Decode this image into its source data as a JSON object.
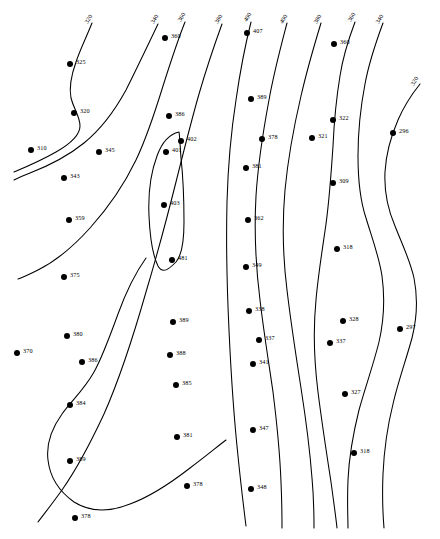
{
  "figure": {
    "type": "contour-map",
    "background_color": "#ffffff",
    "line_color": "#000000",
    "point_color": "#000000",
    "width": 440,
    "height": 539
  },
  "chart_data": {
    "type": "scatter",
    "title": "",
    "subtitle": "",
    "xlabel": "",
    "ylabel": "",
    "grid": false,
    "legend": null,
    "axis_visible": false,
    "contour_interval": 20,
    "contour_labels": [
      {
        "value": "320",
        "x": 86,
        "y": 20,
        "rotation": -58
      },
      {
        "value": "340",
        "x": 152,
        "y": 20,
        "rotation": -58
      },
      {
        "value": "360",
        "x": 179,
        "y": 18,
        "rotation": -58
      },
      {
        "value": "380",
        "x": 216,
        "y": 20,
        "rotation": -58
      },
      {
        "value": "400",
        "x": 245,
        "y": 18,
        "rotation": -58
      },
      {
        "value": "400",
        "x": 281,
        "y": 20,
        "rotation": -58
      },
      {
        "value": "380",
        "x": 315,
        "y": 20,
        "rotation": -58
      },
      {
        "value": "360",
        "x": 349,
        "y": 18,
        "rotation": -58
      },
      {
        "value": "340",
        "x": 377,
        "y": 20,
        "rotation": -58
      },
      {
        "value": "320",
        "x": 412,
        "y": 82,
        "rotation": -58
      }
    ],
    "points": [
      {
        "label": "325",
        "x": 70,
        "y": 64
      },
      {
        "label": "320",
        "x": 74,
        "y": 113
      },
      {
        "label": "310",
        "x": 31,
        "y": 150
      },
      {
        "label": "345",
        "x": 99,
        "y": 152
      },
      {
        "label": "343",
        "x": 64,
        "y": 178
      },
      {
        "label": "359",
        "x": 69,
        "y": 220
      },
      {
        "label": "375",
        "x": 64,
        "y": 277
      },
      {
        "label": "370",
        "x": 17,
        "y": 353
      },
      {
        "label": "380",
        "x": 67,
        "y": 336
      },
      {
        "label": "386",
        "x": 82,
        "y": 362
      },
      {
        "label": "384",
        "x": 70,
        "y": 405
      },
      {
        "label": "389",
        "x": 70,
        "y": 461
      },
      {
        "label": "378",
        "x": 75,
        "y": 518
      },
      {
        "label": "360",
        "x": 165,
        "y": 38
      },
      {
        "label": "386",
        "x": 169,
        "y": 116
      },
      {
        "label": "402",
        "x": 181,
        "y": 141
      },
      {
        "label": "401",
        "x": 166,
        "y": 152
      },
      {
        "label": "403",
        "x": 164,
        "y": 205
      },
      {
        "label": "481",
        "x": 172,
        "y": 260
      },
      {
        "label": "389",
        "x": 173,
        "y": 322
      },
      {
        "label": "388",
        "x": 170,
        "y": 355
      },
      {
        "label": "385",
        "x": 176,
        "y": 385
      },
      {
        "label": "381",
        "x": 177,
        "y": 437
      },
      {
        "label": "378",
        "x": 187,
        "y": 486
      },
      {
        "label": "407",
        "x": 247,
        "y": 33
      },
      {
        "label": "389",
        "x": 251,
        "y": 99
      },
      {
        "label": "378",
        "x": 262,
        "y": 139
      },
      {
        "label": "381",
        "x": 246,
        "y": 168
      },
      {
        "label": "362",
        "x": 248,
        "y": 220
      },
      {
        "label": "349",
        "x": 246,
        "y": 267
      },
      {
        "label": "338",
        "x": 249,
        "y": 311
      },
      {
        "label": "337",
        "x": 259,
        "y": 340
      },
      {
        "label": "341",
        "x": 253,
        "y": 364
      },
      {
        "label": "347",
        "x": 253,
        "y": 430
      },
      {
        "label": "348",
        "x": 251,
        "y": 489
      },
      {
        "label": "360",
        "x": 334,
        "y": 44
      },
      {
        "label": "322",
        "x": 333,
        "y": 120
      },
      {
        "label": "321",
        "x": 312,
        "y": 138
      },
      {
        "label": "296",
        "x": 393,
        "y": 133
      },
      {
        "label": "309",
        "x": 333,
        "y": 183
      },
      {
        "label": "318",
        "x": 337,
        "y": 249
      },
      {
        "label": "328",
        "x": 343,
        "y": 321
      },
      {
        "label": "337",
        "x": 330,
        "y": 343
      },
      {
        "label": "297",
        "x": 400,
        "y": 329
      },
      {
        "label": "327",
        "x": 345,
        "y": 394
      },
      {
        "label": "318",
        "x": 354,
        "y": 453
      }
    ],
    "contours": [
      {
        "id": "contour-320-left",
        "value": "320",
        "path": "M 92 23 C 86 38 80 50 76 62 C 71 76 69 88 71 98 C 74 110 80 116 80 126 C 80 136 70 144 56 152 C 42 160 26 167 14 172"
      },
      {
        "id": "contour-340-left",
        "value": "340",
        "path": "M 158 24 C 148 45 137 68 126 90 C 114 112 100 130 84 143 C 68 156 48 166 30 173 C 22 176 18 178 14 180"
      },
      {
        "id": "contour-360-left",
        "value": "360",
        "path": "M 185 22 C 177 42 170 64 163 86 C 155 112 147 137 136 160 C 124 185 108 208 90 228 C 72 248 54 262 38 270 C 30 274 24 277 18 279"
      },
      {
        "id": "contour-380-mid",
        "value": "380",
        "path": "M 222 24 C 214 46 206 70 199 94 C 191 122 184 150 177 178 C 168 214 158 252 146 292 C 134 334 120 378 104 414 C 90 444 76 470 62 490 C 52 504 44 514 38 522"
      },
      {
        "id": "contour-400-closed",
        "value": "400",
        "path": "M 179 132 C 170 134 162 142 157 156 C 151 172 148 194 149 216 C 150 238 153 256 158 266 C 163 275 170 268 176 262 C 182 255 184 240 184 222 C 184 200 183 176 181 158 C 180 146 180 138 179 132 Z"
      },
      {
        "id": "contour-400-right-a",
        "value": "400",
        "path": "M 251 22 C 245 46 240 72 236 100 C 231 132 228 166 227 202 C 226 244 227 288 229 330 C 231 374 234 418 238 456 C 241 486 244 510 246 526"
      },
      {
        "id": "contour-400-right-b",
        "value": "400",
        "path": "M 287 23 C 281 46 274 72 269 100 C 263 132 258 164 256 196 C 254 232 256 268 260 300 C 264 334 269 364 273 392 C 277 424 280 456 281 482 C 282 504 282 518 282 528"
      },
      {
        "id": "contour-380-right",
        "value": "380",
        "path": "M 321 23 C 314 46 307 70 301 96 C 294 126 288 158 285 190 C 282 224 283 258 287 290 C 291 324 296 356 301 388 C 306 420 310 452 312 478 C 314 500 314 516 314 528"
      },
      {
        "id": "contour-360-right",
        "value": "360",
        "path": "M 355 22 C 349 38 343 56 340 76 C 336 100 334 124 333 146 C 331 176 329 202 326 224 C 322 252 318 276 316 300 C 313 330 314 360 318 392 C 322 424 327 456 331 482 C 334 504 336 518 337 528"
      },
      {
        "id": "contour-340-right",
        "value": "340",
        "path": "M 383 23 C 376 42 369 62 365 84 C 360 110 358 134 358 156 C 358 180 360 200 366 218 C 372 238 379 256 382 276 C 385 298 384 320 379 342 C 373 366 365 388 359 410 C 353 434 349 458 348 480 C 347 502 348 518 348 528"
      },
      {
        "id": "contour-320-right",
        "value": "320",
        "path": "M 420 84 C 412 94 404 106 398 120 C 391 136 386 154 385 172 C 384 192 388 210 395 226 C 402 244 410 260 414 278 C 418 298 417 318 412 338 C 406 360 398 382 393 404 C 387 428 384 452 383 474 C 382 498 383 516 384 528"
      },
      {
        "id": "contour-370-lobe",
        "value": "370",
        "path": "M 146 258 C 136 272 126 292 118 314 C 110 336 102 358 94 372 C 84 390 72 400 62 414 C 52 428 46 444 48 460 C 50 478 60 492 74 502 C 90 512 110 512 130 504 C 152 496 172 482 190 468 C 206 456 218 446 226 440"
      }
    ]
  }
}
